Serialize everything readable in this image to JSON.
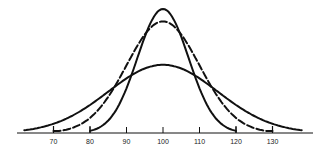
{
  "chart_data": {
    "type": "line",
    "title": "",
    "xlabel": "",
    "ylabel": "",
    "x_ticks": [
      70,
      80,
      90,
      100,
      110,
      120,
      130
    ],
    "tick_labels": [
      "70",
      "80",
      "90",
      "100",
      "110",
      "120",
      "130"
    ],
    "xlim": [
      57,
      139
    ],
    "grid": false,
    "legend": null,
    "series": [
      {
        "name": "narrow-normal",
        "style": "solid",
        "mean": 100,
        "sd": 7,
        "x_range": [
          80,
          120
        ],
        "relative_peak": 1.0
      },
      {
        "name": "medium-normal",
        "style": "dashed",
        "mean": 100,
        "sd": 10,
        "x_range": [
          70,
          130
        ],
        "relative_peak": 0.9
      },
      {
        "name": "wide-normal",
        "style": "solid",
        "mean": 100,
        "sd": 15,
        "x_range": [
          62,
          138
        ],
        "relative_peak": 0.55
      }
    ]
  },
  "colors": {
    "line": "#111111",
    "background": "#ffffff"
  }
}
